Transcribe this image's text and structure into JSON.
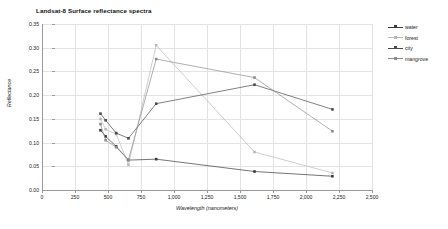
{
  "chart_data": {
    "type": "line",
    "title": "Landsat-8  Surface reflectance spectra",
    "xlabel": "Wavelength (nanometers)",
    "ylabel": "Reflectance",
    "xlim": [
      0,
      2500
    ],
    "ylim": [
      0.0,
      0.35
    ],
    "xticks": [
      0,
      250,
      500,
      750,
      1000,
      1250,
      1500,
      1750,
      2000,
      2250,
      2500
    ],
    "xtick_labels": [
      "0",
      "250",
      "500",
      "750",
      "1,000",
      "1,250",
      "1,500",
      "1,750",
      "2,000",
      "2,250",
      "2,500"
    ],
    "yticks": [
      0.0,
      0.05,
      0.1,
      0.15,
      0.2,
      0.25,
      0.3,
      0.35
    ],
    "ytick_labels": [
      "0.00",
      "0.05",
      "0.10",
      "0.15",
      "0.20",
      "0.25",
      "0.30",
      "0.35"
    ],
    "grid": true,
    "legend_position": "right",
    "x": [
      443,
      482,
      562,
      655,
      865,
      1610,
      2200
    ],
    "series": [
      {
        "name": "water",
        "color": "#3a3a3a",
        "marker": "square",
        "values": [
          0.126,
          0.113,
          0.092,
          0.063,
          0.065,
          0.039,
          0.029
        ]
      },
      {
        "name": "forest",
        "color": "#b9b9b9",
        "marker": "square",
        "values": [
          0.15,
          0.128,
          0.118,
          0.053,
          0.305,
          0.08,
          0.036
        ]
      },
      {
        "name": "city",
        "color": "#4a4a4a",
        "marker": "square",
        "values": [
          0.161,
          0.147,
          0.12,
          0.109,
          0.182,
          0.222,
          0.17
        ]
      },
      {
        "name": "mangrove",
        "color": "#8c8c8c",
        "marker": "square",
        "values": [
          0.139,
          0.105,
          0.09,
          0.064,
          0.276,
          0.237,
          0.124
        ]
      }
    ]
  }
}
